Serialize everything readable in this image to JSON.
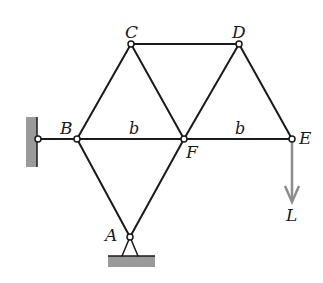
{
  "diagram": {
    "type": "truss",
    "colors": {
      "member": "#1a1a1a",
      "support_fill": "#9a9a9a",
      "load_arrow": "#8c8c8c",
      "background": "#ffffff"
    },
    "nodes": [
      {
        "id": "A",
        "label": "A",
        "x": 130,
        "y": 237
      },
      {
        "id": "B",
        "label": "B",
        "x": 77,
        "y": 139
      },
      {
        "id": "C",
        "label": "C",
        "x": 131,
        "y": 44
      },
      {
        "id": "D",
        "label": "D",
        "x": 239,
        "y": 44
      },
      {
        "id": "E",
        "label": "E",
        "x": 292,
        "y": 139
      },
      {
        "id": "F",
        "label": "F",
        "x": 184,
        "y": 139
      }
    ],
    "members": [
      [
        "A",
        "B"
      ],
      [
        "A",
        "F"
      ],
      [
        "B",
        "C"
      ],
      [
        "C",
        "F"
      ],
      [
        "C",
        "D"
      ],
      [
        "D",
        "F"
      ],
      [
        "D",
        "E"
      ],
      [
        "B",
        "F"
      ],
      [
        "F",
        "E"
      ],
      [
        "W",
        "B"
      ]
    ],
    "dimensions": [
      {
        "label": "b",
        "between": [
          "B",
          "F"
        ]
      },
      {
        "label": "b",
        "between": [
          "F",
          "E"
        ]
      }
    ],
    "supports": {
      "wall": {
        "pin_x": 38,
        "pin_y": 139,
        "description": "wall pin at left connected to B"
      },
      "ground": {
        "node": "A",
        "description": "pinned ground support below A"
      }
    },
    "load": {
      "label": "L",
      "at": "E",
      "direction": "down"
    }
  }
}
